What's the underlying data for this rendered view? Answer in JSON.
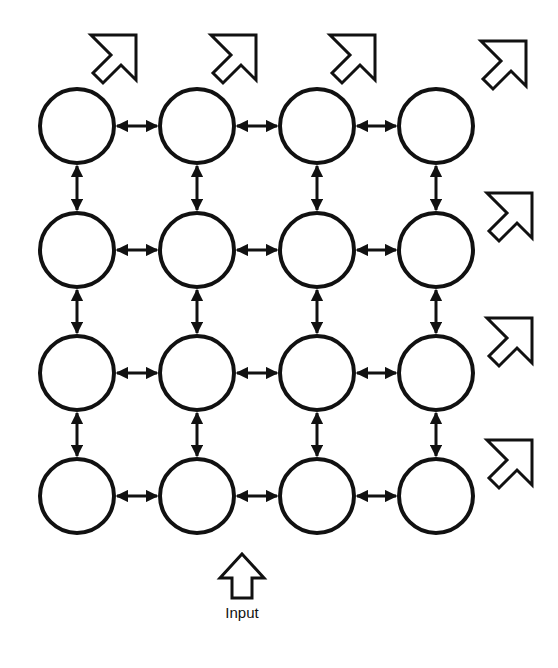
{
  "diagram": {
    "title": "",
    "type": "2D mesh processor array",
    "grid": {
      "rows": 4,
      "cols": 4
    },
    "node_centers_x": [
      77,
      197,
      317,
      436
    ],
    "node_centers_y": [
      126,
      250,
      373,
      496
    ],
    "node_radius": 37,
    "stroke_color": "#111111",
    "background_color": "#ffffff",
    "connections": "bidirectional arrows between horizontally and vertically adjacent nodes",
    "output_arrows": [
      {
        "x": 88,
        "y": 32,
        "direction": "north-east",
        "position": "above column 1"
      },
      {
        "x": 208,
        "y": 32,
        "direction": "north-east",
        "position": "above column 2"
      },
      {
        "x": 327,
        "y": 32,
        "direction": "north-east",
        "position": "above column 3"
      },
      {
        "x": 478,
        "y": 38,
        "direction": "north-east",
        "position": "top-right corner"
      },
      {
        "x": 484,
        "y": 190,
        "direction": "north-east",
        "position": "right of row 2"
      },
      {
        "x": 484,
        "y": 315,
        "direction": "north-east",
        "position": "right of row 3"
      },
      {
        "x": 484,
        "y": 437,
        "direction": "north-east",
        "position": "right of row 4"
      }
    ],
    "input_arrow": {
      "x": 218,
      "y": 552,
      "direction": "up",
      "label": "Input"
    }
  }
}
